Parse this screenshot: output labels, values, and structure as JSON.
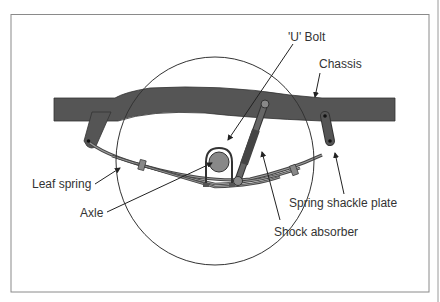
{
  "diagram": {
    "colors": {
      "frame": "#8a8a8a",
      "chassis_fill": "#555555",
      "line": "#222222",
      "label_text": "#333333"
    },
    "labels": {
      "u_bolt": "'U' Bolt",
      "chassis": "Chassis",
      "leaf_spring": "Leaf spring",
      "axle": "Axle",
      "spring_shackle_plate": "Spring shackle plate",
      "shock_absorber": "Shock absorber"
    }
  }
}
